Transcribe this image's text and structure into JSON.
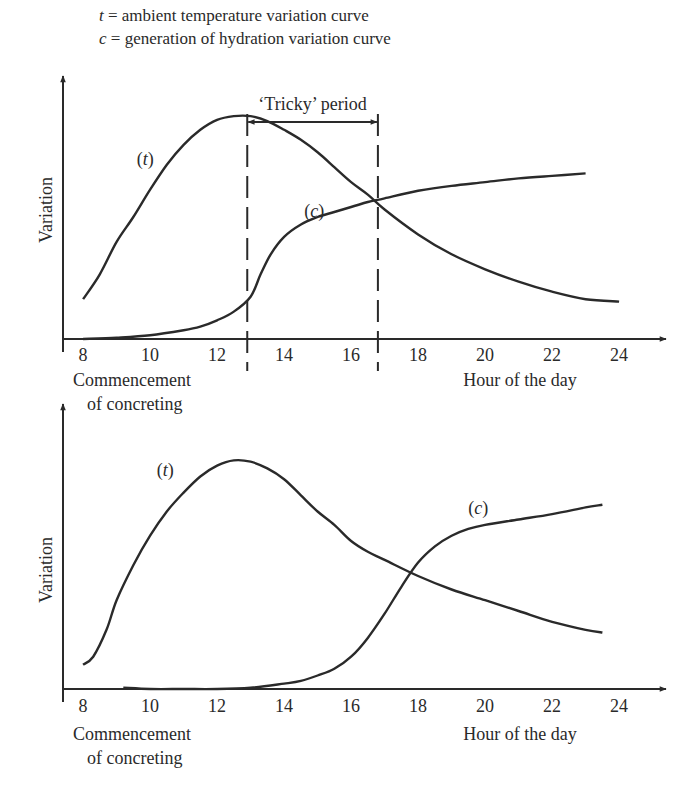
{
  "legend": [
    {
      "symbol": "t",
      "text": " = ambient temperature variation curve"
    },
    {
      "symbol": "c",
      "text": " = generation of hydration variation curve"
    }
  ],
  "chart_data": [
    {
      "type": "line",
      "title": "",
      "xlabel": "Hour of the day",
      "ylabel": "Variation",
      "x_note": [
        "Commencement",
        "of concreting"
      ],
      "xticks": [
        8,
        10,
        12,
        14,
        16,
        18,
        20,
        22,
        24
      ],
      "xlim": [
        7.4,
        25.4
      ],
      "ylim": [
        0,
        10
      ],
      "grid": false,
      "series": [
        {
          "name": "(t)",
          "label": "(t)",
          "label_at": [
            9.6,
            7.0
          ],
          "x": [
            8,
            8.5,
            9,
            9.5,
            10,
            10.5,
            11,
            11.5,
            12,
            12.5,
            13,
            13.5,
            14,
            14.5,
            15,
            15.5,
            16,
            16.5,
            17,
            18,
            19,
            20,
            21,
            22,
            23,
            24
          ],
          "y": [
            1.6,
            2.6,
            3.9,
            4.9,
            6.0,
            7.0,
            7.8,
            8.4,
            8.8,
            8.95,
            8.95,
            8.75,
            8.4,
            8.0,
            7.5,
            6.9,
            6.3,
            5.8,
            5.2,
            4.2,
            3.4,
            2.8,
            2.3,
            1.9,
            1.6,
            1.5
          ]
        },
        {
          "name": "(c)",
          "label": "(c)",
          "label_at": [
            14.6,
            4.9
          ],
          "x": [
            8,
            9,
            10,
            11,
            11.5,
            12,
            12.5,
            13,
            13.3,
            13.6,
            14,
            14.5,
            15,
            15.5,
            16,
            16.5,
            17,
            18,
            19,
            20,
            21,
            22,
            23
          ],
          "y": [
            0.0,
            0.05,
            0.15,
            0.35,
            0.5,
            0.75,
            1.1,
            1.7,
            2.6,
            3.4,
            4.1,
            4.6,
            4.9,
            5.1,
            5.3,
            5.5,
            5.65,
            5.95,
            6.15,
            6.3,
            6.45,
            6.55,
            6.65
          ]
        }
      ],
      "annotations": {
        "tricky_period_label": "‘Tricky’ period",
        "tricky_period_from": 12.9,
        "tricky_period_to": 16.8
      }
    },
    {
      "type": "line",
      "title": "",
      "xlabel": "Hour of the day",
      "ylabel": "Variation",
      "x_note": [
        "Commencement",
        "of concreting"
      ],
      "xticks": [
        8,
        10,
        12,
        14,
        16,
        18,
        20,
        22,
        24
      ],
      "xlim": [
        7.4,
        25.4
      ],
      "ylim": [
        0,
        10
      ],
      "grid": false,
      "series": [
        {
          "name": "(t)",
          "label": "(t)",
          "label_at": [
            10.2,
            7.9
          ],
          "x": [
            8,
            8.3,
            8.7,
            9,
            9.5,
            10,
            10.5,
            11,
            11.5,
            12,
            12.5,
            13,
            13.5,
            14,
            14.5,
            15,
            15.5,
            16,
            16.5,
            17,
            18,
            19,
            20,
            21,
            22,
            23,
            23.5
          ],
          "y": [
            0.9,
            1.2,
            2.2,
            3.3,
            4.6,
            5.7,
            6.6,
            7.3,
            7.9,
            8.3,
            8.5,
            8.45,
            8.2,
            7.8,
            7.2,
            6.6,
            6.1,
            5.5,
            5.1,
            4.8,
            4.2,
            3.7,
            3.3,
            2.9,
            2.5,
            2.2,
            2.1
          ]
        },
        {
          "name": "(c)",
          "label": "(c)",
          "label_at": [
            19.5,
            6.5
          ],
          "x": [
            9.2,
            10,
            11,
            12,
            13,
            14,
            14.5,
            15,
            15.5,
            16,
            16.5,
            17,
            17.5,
            18,
            18.5,
            19,
            19.5,
            20,
            21,
            22,
            23,
            23.5
          ],
          "y": [
            0.05,
            0.0,
            0.0,
            0.0,
            0.05,
            0.2,
            0.3,
            0.5,
            0.75,
            1.2,
            1.9,
            2.8,
            3.8,
            4.7,
            5.3,
            5.7,
            5.95,
            6.1,
            6.3,
            6.5,
            6.75,
            6.85
          ]
        }
      ]
    }
  ]
}
